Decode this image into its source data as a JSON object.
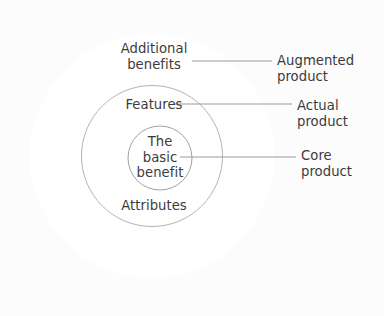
{
  "diagram": {
    "type": "concentric-circles",
    "background_color": "#fbfbfb",
    "text_color": "#3b3b3b",
    "line_color": "#b3b3b3",
    "circle_fill": "#ffffff",
    "center": {
      "x": 152,
      "y": 156
    },
    "rings": [
      {
        "id": "augmented",
        "inner_label": "Additional\nbenefits",
        "side_label": "Augmented\nproduct",
        "radius": 122,
        "stroke": "none",
        "fill": "#ffffff"
      },
      {
        "id": "actual",
        "inner_label": "Features",
        "secondary_inner_label": "Attributes",
        "side_label": "Actual\nproduct",
        "radius": 71,
        "stroke": "#b3b3b3",
        "fill": "none"
      },
      {
        "id": "core",
        "inner_label": "The\nbasic\nbenefit",
        "side_label": "Core\nproduct",
        "radius": 32,
        "stroke": "#9f9f9f",
        "fill": "none"
      }
    ],
    "leader_lines": [
      {
        "name": "augmented-leader",
        "x1": 192,
        "y1": 61,
        "x2": 272,
        "y2": 61
      },
      {
        "name": "actual-leader",
        "x1": 172,
        "y1": 104,
        "x2": 292,
        "y2": 104
      },
      {
        "name": "core-leader",
        "x1": 170,
        "y1": 156,
        "x2": 296,
        "y2": 156
      }
    ]
  },
  "labels": {
    "additional_benefits": "Additional\nbenefits",
    "features": "Features",
    "basic_benefit": "The\nbasic\nbenefit",
    "attributes": "Attributes",
    "augmented_product": "Augmented\nproduct",
    "actual_product": "Actual\nproduct",
    "core_product": "Core\nproduct"
  }
}
